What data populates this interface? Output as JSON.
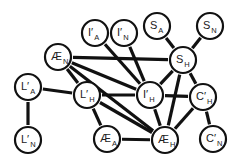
{
  "diagram": {
    "type": "undirected-graph",
    "nodes": [
      {
        "id": "IpA",
        "base": "I′",
        "sub": "A",
        "x": 95,
        "y": 33
      },
      {
        "id": "IpN",
        "base": "I′",
        "sub": "N",
        "x": 124,
        "y": 33
      },
      {
        "id": "SA",
        "base": "S",
        "sub": "A",
        "x": 157,
        "y": 26
      },
      {
        "id": "SN",
        "base": "S",
        "sub": "N",
        "x": 210,
        "y": 26
      },
      {
        "id": "AEN",
        "base": "Æ",
        "sub": "N",
        "x": 58,
        "y": 57
      },
      {
        "id": "SH",
        "base": "S",
        "sub": "H",
        "x": 183,
        "y": 60
      },
      {
        "id": "LpA",
        "base": "L′",
        "sub": "A",
        "x": 28,
        "y": 87
      },
      {
        "id": "LpH",
        "base": "L′",
        "sub": "H",
        "x": 87,
        "y": 95
      },
      {
        "id": "IpH",
        "base": "I′",
        "sub": "H",
        "x": 150,
        "y": 95
      },
      {
        "id": "CpH",
        "base": "C′",
        "sub": "H",
        "x": 203,
        "y": 97
      },
      {
        "id": "LpN",
        "base": "L′",
        "sub": "N",
        "x": 28,
        "y": 140
      },
      {
        "id": "AEA",
        "base": "Æ",
        "sub": "A",
        "x": 107,
        "y": 139
      },
      {
        "id": "AEH",
        "base": "Æ",
        "sub": "H",
        "x": 165,
        "y": 140
      },
      {
        "id": "CpN",
        "base": "C′",
        "sub": "N",
        "x": 213,
        "y": 139
      }
    ],
    "edges": [
      [
        "IpA",
        "IpH"
      ],
      [
        "IpN",
        "IpH"
      ],
      [
        "SA",
        "SH"
      ],
      [
        "SN",
        "SH"
      ],
      [
        "AEN",
        "SH"
      ],
      [
        "AEN",
        "LpH"
      ],
      [
        "AEN",
        "IpH"
      ],
      [
        "AEN",
        "AEH"
      ],
      [
        "LpA",
        "LpH"
      ],
      [
        "LpA",
        "LpN"
      ],
      [
        "LpH",
        "IpH"
      ],
      [
        "LpH",
        "AEA"
      ],
      [
        "LpH",
        "AEH"
      ],
      [
        "IpH",
        "SH"
      ],
      [
        "IpH",
        "AEH"
      ],
      [
        "IpH",
        "CpH"
      ],
      [
        "SH",
        "CpH"
      ],
      [
        "SH",
        "AEH"
      ],
      [
        "CpH",
        "AEH"
      ],
      [
        "CpH",
        "CpN"
      ],
      [
        "AEA",
        "AEH"
      ]
    ],
    "node_radius": 13,
    "colors": {
      "stroke": "#111111",
      "fill": "#ffffff",
      "text": "#222222",
      "background": "#ffffff"
    }
  }
}
